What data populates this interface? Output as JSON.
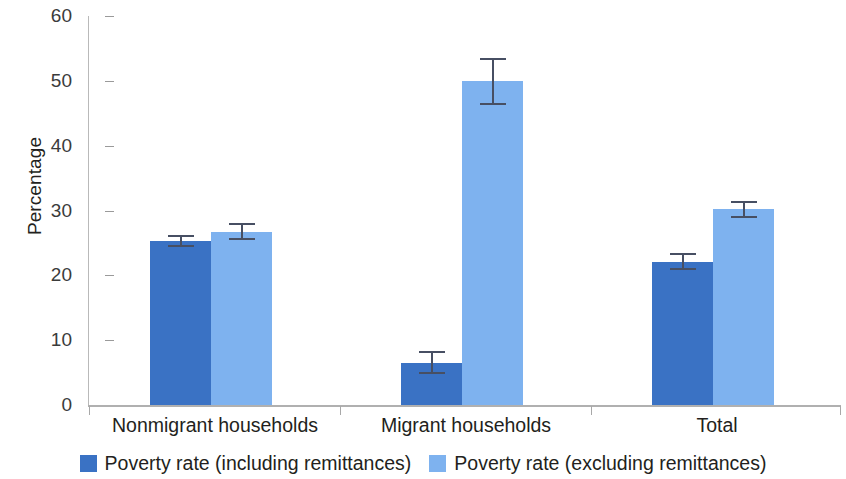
{
  "chart_data": {
    "type": "bar",
    "title": "",
    "xlabel": "",
    "ylabel": "Percentage",
    "ylim": [
      0,
      60
    ],
    "yticks": [
      0,
      10,
      20,
      30,
      40,
      50,
      60
    ],
    "ytick_labels": [
      "0",
      "10",
      "20",
      "30",
      "40",
      "50",
      "60"
    ],
    "grid": false,
    "legend_position": "bottom",
    "categories": [
      "Nonmigrant households",
      "Migrant households",
      "Total"
    ],
    "series": [
      {
        "name": "Poverty rate (including remittances)",
        "color": "#3a72c4",
        "values": [
          25.3,
          6.5,
          22.1
        ],
        "errors_low": [
          24.3,
          4.8,
          20.9
        ],
        "errors_high": [
          26.3,
          8.3,
          23.4
        ]
      },
      {
        "name": "Poverty rate (excluding remittances)",
        "color": "#7eb2ef",
        "values": [
          26.7,
          49.9,
          30.2
        ],
        "errors_low": [
          25.5,
          46.2,
          28.9
        ],
        "errors_high": [
          28.0,
          53.5,
          31.5
        ]
      }
    ],
    "error_bar_color": "#474f63",
    "axis_color": "#b0b0b0"
  }
}
